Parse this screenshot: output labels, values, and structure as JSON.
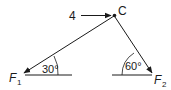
{
  "diagram": {
    "type": "force-diagram",
    "point": {
      "label": "C"
    },
    "forces": [
      {
        "id": "applied",
        "label": "4",
        "direction": "horizontal-right"
      },
      {
        "id": "F1",
        "label": "F",
        "subscript": "1",
        "angle_label": "30°"
      },
      {
        "id": "F2",
        "label": "F",
        "subscript": "2",
        "angle_label": "60°"
      }
    ],
    "colors": {
      "stroke": "#1a1a1a",
      "background": "#ffffff"
    }
  }
}
